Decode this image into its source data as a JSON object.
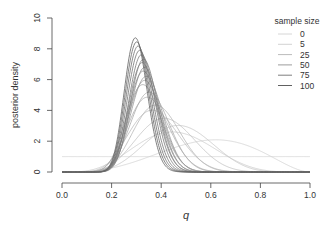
{
  "chart_data": {
    "type": "line",
    "title": "",
    "xlabel": "q",
    "ylabel": "posterior density",
    "xlim": [
      0.0,
      1.0
    ],
    "ylim": [
      0,
      10
    ],
    "x_ticks": [
      "0.0",
      "0.2",
      "0.4",
      "0.6",
      "0.8",
      "1.0"
    ],
    "y_ticks": [
      "0",
      "2",
      "4",
      "6",
      "8",
      "10"
    ],
    "grid": false,
    "legend": {
      "title": "sample size",
      "position": "top-right",
      "entries": [
        "0",
        "5",
        "25",
        "50",
        "75",
        "100"
      ]
    },
    "series": [
      {
        "name": "0",
        "alpha": 1,
        "beta": 1,
        "color": "#d6d6d6"
      },
      {
        "name": "5",
        "alpha": 4.1,
        "beta": 2.9,
        "color": "#d2d2d2"
      },
      {
        "name": "10",
        "alpha": 5,
        "beta": 6,
        "color": "#cccccc"
      },
      {
        "name": "15",
        "alpha": 7,
        "beta": 7.8,
        "color": "#c6c6c6"
      },
      {
        "name": "20",
        "alpha": 8,
        "beta": 11,
        "color": "#c0c0c0"
      },
      {
        "name": "25",
        "alpha": 9,
        "beta": 15,
        "color": "#bbbbbb"
      },
      {
        "name": "30",
        "alpha": 11,
        "beta": 17.5,
        "color": "#b5b5b5"
      },
      {
        "name": "35",
        "alpha": 12,
        "beta": 22,
        "color": "#afafaf"
      },
      {
        "name": "40",
        "alpha": 14,
        "beta": 25,
        "color": "#a9a9a9"
      },
      {
        "name": "45",
        "alpha": 15,
        "beta": 30,
        "color": "#a3a3a3"
      },
      {
        "name": "50",
        "alpha": 17,
        "beta": 33,
        "color": "#9d9d9d"
      },
      {
        "name": "55",
        "alpha": 19,
        "beta": 36,
        "color": "#979797"
      },
      {
        "name": "60",
        "alpha": 20,
        "beta": 40,
        "color": "#919191"
      },
      {
        "name": "65",
        "alpha": 22,
        "beta": 43,
        "color": "#8b8b8b"
      },
      {
        "name": "70",
        "alpha": 23,
        "beta": 47,
        "color": "#858585"
      },
      {
        "name": "75",
        "alpha": 25,
        "beta": 50,
        "color": "#7f7f7f"
      },
      {
        "name": "80",
        "alpha": 26,
        "beta": 54,
        "color": "#797979"
      },
      {
        "name": "85",
        "alpha": 27,
        "beta": 58,
        "color": "#737373"
      },
      {
        "name": "90",
        "alpha": 28,
        "beta": 62,
        "color": "#6d6d6d"
      },
      {
        "name": "95",
        "alpha": 29,
        "beta": 66,
        "color": "#676767"
      },
      {
        "name": "100",
        "alpha": 30,
        "beta": 70,
        "color": "#616161"
      }
    ]
  },
  "legend_colors": [
    "#d6d6d6",
    "#d2d2d2",
    "#bbbbbb",
    "#9d9d9d",
    "#7f7f7f",
    "#616161"
  ]
}
